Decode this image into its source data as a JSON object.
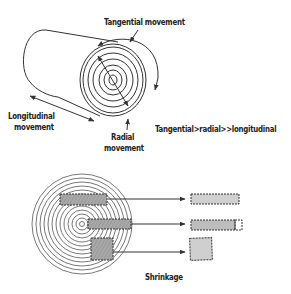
{
  "labels": {
    "tangential": "Tangential movement",
    "longitudinal_1": "Longitudinal",
    "longitudinal_2": "movement",
    "radial_1": "Radial",
    "radial_2": "movement",
    "relation": "Tangential>radial>>longitudinal",
    "shrinkage": "Shrinkage"
  },
  "colors": {
    "line": "#333333",
    "fill_gray": "#b5b5b5",
    "fill_light": "#cfcfcf",
    "background": "#ffffff"
  },
  "figure": {
    "top": "Wood log (cylinder) with growth rings showing directional movement",
    "bottom": "Cross-section disc with cut pieces and their shrunken shapes",
    "ring_count_log_end": 6,
    "pieces": [
      "tangential board (flat-sawn)",
      "radial board (quarter-sawn)",
      "square piece"
    ]
  }
}
